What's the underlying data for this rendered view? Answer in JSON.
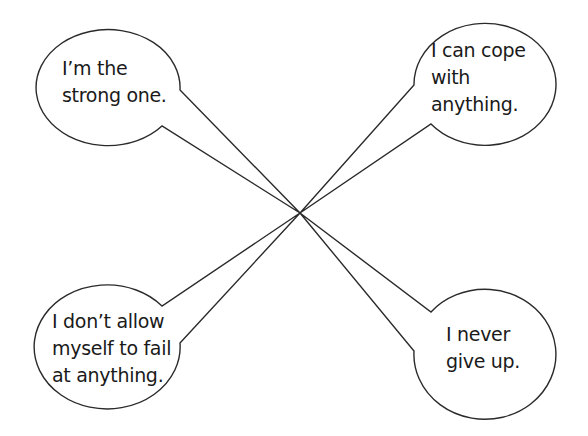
{
  "diagram": {
    "center": {
      "x": 300,
      "y": 213
    },
    "stroke_color": "#2a2a2a",
    "bubbles": [
      {
        "id": "top-left",
        "text": "I’m the\nstrong one.",
        "lines": [
          "I’m the",
          "strong one."
        ]
      },
      {
        "id": "top-right",
        "text": "I can cope\nwith\nanything.",
        "lines": [
          "I can cope",
          "with",
          "anything."
        ]
      },
      {
        "id": "bottom-left",
        "text": "I don’t allow\nmyself to fail\nat anything.",
        "lines": [
          "I don’t allow",
          "myself to fail",
          "at anything."
        ]
      },
      {
        "id": "bottom-right",
        "text": "I never\ngive up.",
        "lines": [
          "I never",
          "give up."
        ]
      }
    ]
  }
}
